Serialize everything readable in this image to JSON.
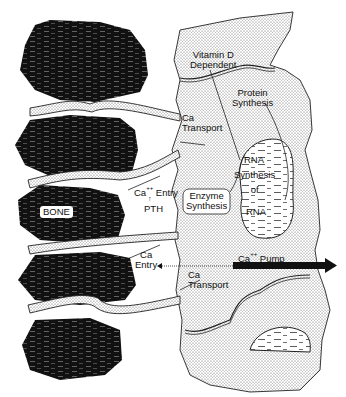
{
  "diagram": {
    "type": "biological schematic",
    "colors": {
      "bone": "#111111",
      "stipple": "#444444",
      "line": "#111111",
      "background": "#ffffff"
    },
    "labels": {
      "vitamin_d": [
        "Vitamin D",
        "Dependent"
      ],
      "protein_synthesis": [
        "Protein",
        "Synthesis"
      ],
      "ca_transport_upper": [
        "Ca",
        "Transport"
      ],
      "rna_top": "RNA",
      "synthesis_of": [
        "Synthesis",
        "of"
      ],
      "rna_bottom": "RNA",
      "ca_entry_upper": "Ca",
      "ca_entry_upper_sup": "++",
      "ca_entry_upper_word": "Entry",
      "pth": "PTH",
      "enzyme_synthesis": [
        "Enzyme",
        "Synthesis"
      ],
      "bone": "BONE",
      "ca_entry_lower": [
        "Ca",
        "Entry"
      ],
      "ca_pump": "Ca",
      "ca_pump_sup": "++",
      "ca_pump_word": "Pump",
      "ca_transport_lower": [
        "Ca",
        "Transport"
      ]
    }
  }
}
